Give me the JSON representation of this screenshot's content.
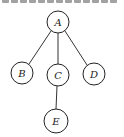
{
  "diagram": {
    "type": "tree",
    "caption_clipped": true,
    "nodes": [
      {
        "id": "A",
        "label": "A",
        "x": 58,
        "y": 22,
        "r": 11
      },
      {
        "id": "B",
        "label": "B",
        "x": 22,
        "y": 73,
        "r": 11
      },
      {
        "id": "C",
        "label": "C",
        "x": 58,
        "y": 75,
        "r": 11
      },
      {
        "id": "D",
        "label": "D",
        "x": 94,
        "y": 74,
        "r": 11
      },
      {
        "id": "E",
        "label": "E",
        "x": 56,
        "y": 121,
        "r": 12
      }
    ],
    "edges": [
      {
        "from": "A",
        "to": "B"
      },
      {
        "from": "A",
        "to": "C"
      },
      {
        "from": "A",
        "to": "D"
      },
      {
        "from": "C",
        "to": "E"
      }
    ],
    "colors": {
      "stroke": "#222222",
      "background": "#ffffff"
    }
  }
}
